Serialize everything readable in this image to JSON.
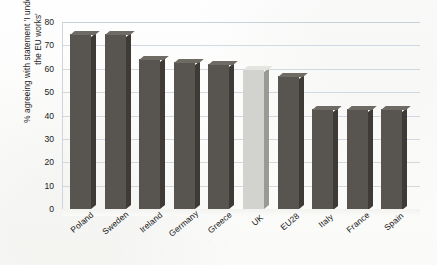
{
  "chart_data": {
    "type": "bar",
    "title": "",
    "subtitle": "",
    "xlabel": "",
    "ylabel": "% agreeing with statement 'I understand how\nthe EU works'",
    "ylim": [
      0,
      80
    ],
    "ytick_labels": [
      "80",
      "70",
      "60",
      "50",
      "40",
      "30",
      "20",
      "10",
      "0"
    ],
    "yticks": [
      80,
      70,
      60,
      50,
      40,
      30,
      20,
      10,
      0
    ],
    "grid": true,
    "legend": "none",
    "categories": [
      "Poland",
      "Sweden",
      "Ireland",
      "Germany",
      "Greece",
      "UK",
      "EU28",
      "Italy",
      "France",
      "Spain"
    ],
    "values": [
      75,
      75,
      64,
      63,
      62,
      60,
      57,
      43,
      43,
      43
    ],
    "bars": [
      {
        "category": "Poland",
        "value": 75,
        "highlight": false
      },
      {
        "category": "Sweden",
        "value": 75,
        "highlight": false
      },
      {
        "category": "Ireland",
        "value": 64,
        "highlight": false
      },
      {
        "category": "Germany",
        "value": 63,
        "highlight": false
      },
      {
        "category": "Greece",
        "value": 62,
        "highlight": false
      },
      {
        "category": "UK",
        "value": 60,
        "highlight": true
      },
      {
        "category": "EU28",
        "value": 57,
        "highlight": false
      },
      {
        "category": "Italy",
        "value": 43,
        "highlight": false
      },
      {
        "category": "France",
        "value": 43,
        "highlight": false
      },
      {
        "category": "Spain",
        "value": 43,
        "highlight": false
      }
    ]
  },
  "colors": {
    "bar_dark_front": "#58544f",
    "bar_dark_side": "#3e3a36",
    "bar_dark_top": "#6e6a64",
    "bar_light_front": "#d2d2ce",
    "bar_light_side": "#9a9a95",
    "bar_light_top": "#e4e4e0",
    "gridline": "#c9d3dd",
    "background": "#fdfdfc",
    "text": "#1a1a1a"
  }
}
